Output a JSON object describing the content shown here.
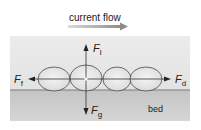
{
  "title": "current flow",
  "labels": {
    "lift": {
      "symbol": "F",
      "subscript": "l"
    },
    "friction": {
      "symbol": "F",
      "subscript": "f"
    },
    "drag": {
      "symbol": "F",
      "subscript": "d"
    },
    "gravity": {
      "symbol": "F",
      "subscript": "g"
    },
    "bed": "bed"
  },
  "colors": {
    "water": "#e6e6e6",
    "bed": "#c8c8c8",
    "bed_line": "#7a7a7a",
    "flow_arrow_start": "#d8d8d8",
    "flow_arrow_end": "#8a8a8a",
    "stroke": "#333333"
  },
  "grains": 4
}
